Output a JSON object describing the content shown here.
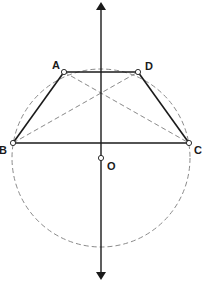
{
  "diagram": {
    "type": "geometry",
    "points": {
      "A": {
        "label": "A",
        "x": 64,
        "y": 72
      },
      "D": {
        "label": "D",
        "x": 138,
        "y": 72
      },
      "B": {
        "label": "B",
        "x": 13,
        "y": 143
      },
      "C": {
        "label": "C",
        "x": 189,
        "y": 143
      },
      "O": {
        "label": "O",
        "x": 101,
        "y": 158
      }
    },
    "circle": {
      "center": "O",
      "radius": 89,
      "style": "dashed"
    },
    "axis": {
      "x": 101,
      "y_top": 2,
      "y_bottom": 280,
      "arrows": "both"
    },
    "segments_solid": [
      "AB",
      "AD",
      "DC",
      "BC"
    ],
    "segments_dashed": [
      "AC",
      "BD"
    ],
    "colors": {
      "line": "#1a1a1a",
      "dashed": "#8a8a8a",
      "point_fill": "#ffffff"
    }
  }
}
